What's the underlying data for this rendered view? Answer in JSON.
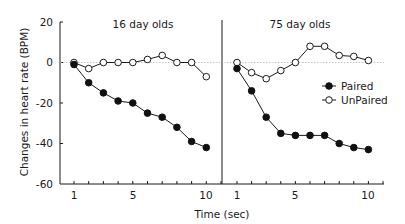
{
  "chart_data": {
    "type": "line",
    "title": "",
    "xlabel": "Time (sec)",
    "ylabel": "Changes in heart rate (BPM)",
    "ylim": [
      -60,
      20
    ],
    "yticks": [
      20,
      0,
      -20,
      -40,
      -60
    ],
    "xticks_labeled": [
      1,
      5,
      10
    ],
    "grid": false,
    "zero_reference_line": true,
    "legend": {
      "position": "inside right panel, upper right",
      "entries": [
        {
          "name": "Paired",
          "marker": "filled-circle"
        },
        {
          "name": "UnPaired",
          "marker": "open-circle"
        }
      ]
    },
    "panels": [
      {
        "title": "16 day olds",
        "x": [
          1,
          2,
          3,
          4,
          5,
          6,
          7,
          8,
          9,
          10
        ],
        "series": [
          {
            "name": "Paired",
            "values": [
              -1,
              -10,
              -15,
              -19,
              -20,
              -25,
              -27,
              -32,
              -39,
              -42
            ]
          },
          {
            "name": "UnPaired",
            "values": [
              0,
              -3,
              0,
              0,
              0,
              1.5,
              3.5,
              0,
              0,
              -7
            ]
          }
        ]
      },
      {
        "title": "75 day olds",
        "x": [
          1,
          2,
          3,
          4,
          5,
          6,
          7,
          8,
          9,
          10
        ],
        "series": [
          {
            "name": "Paired",
            "values": [
              -3,
              -14,
              -27,
              -35,
              -36,
              -36,
              -36,
              -40,
              -42,
              -43
            ]
          },
          {
            "name": "UnPaired",
            "values": [
              0,
              -5,
              -8,
              -4,
              0,
              8,
              8,
              3.5,
              3,
              1
            ]
          }
        ]
      }
    ]
  },
  "labels": {
    "ylabel": "Changes in heart rate (BPM)",
    "xlabel": "Time (sec)",
    "panel_left_title": "16 day olds",
    "panel_right_title": "75 day olds",
    "legend_paired": "Paired",
    "legend_unpaired": "UnPaired",
    "ytick_20": "20",
    "ytick_0": "0",
    "ytick_m20": "-20",
    "ytick_m40": "-40",
    "ytick_m60": "-60",
    "left_xtick_1": "1",
    "left_xtick_5": "5",
    "left_xtick_10": "10",
    "right_xtick_1": "1",
    "right_xtick_5": "5",
    "right_xtick_10": "10"
  },
  "colors": {
    "ink": "#1a1a1a",
    "zero_line": "#b8b8b8",
    "background": "#ffffff"
  }
}
